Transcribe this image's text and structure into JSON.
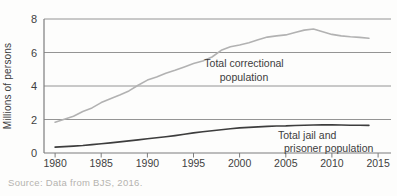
{
  "source": {
    "label": "Source: Data from BJS, 2016."
  },
  "chart_data": {
    "type": "line",
    "title": "",
    "xlabel": "",
    "ylabel": "Millions of persons",
    "grid": "horizontal",
    "legend_position": "inline-annotations",
    "xlim": [
      1978.8,
      2016.4
    ],
    "ylim": [
      0,
      8
    ],
    "x_ticks": [
      1980,
      1985,
      1990,
      1995,
      2000,
      2005,
      2010,
      2015
    ],
    "y_ticks": [
      0,
      2,
      4,
      6,
      8
    ],
    "x_years": [
      1980,
      1981,
      1982,
      1983,
      1984,
      1985,
      1986,
      1987,
      1988,
      1989,
      1990,
      1991,
      1992,
      1993,
      1994,
      1995,
      1996,
      1997,
      1998,
      1999,
      2000,
      2001,
      2002,
      2003,
      2004,
      2005,
      2006,
      2007,
      2008,
      2009,
      2010,
      2011,
      2012,
      2013,
      2014
    ],
    "colors": {
      "grid": "#949494",
      "axis": "#7d7d7d",
      "tick_text": "#3f3f3f",
      "source_text": "#b5b3af",
      "background": "#fdfdfc"
    },
    "series": [
      {
        "id": "total-correctional-population",
        "name": "Total correctional population",
        "color": "#b2b2b2",
        "width": 1.6,
        "values": [
          1.84,
          2.01,
          2.19,
          2.48,
          2.69,
          3.01,
          3.24,
          3.46,
          3.71,
          4.05,
          4.35,
          4.54,
          4.76,
          4.94,
          5.14,
          5.34,
          5.49,
          5.73,
          6.13,
          6.34,
          6.45,
          6.58,
          6.76,
          6.92,
          6.99,
          7.05,
          7.2,
          7.34,
          7.4,
          7.24,
          7.08,
          6.99,
          6.94,
          6.9,
          6.85
        ]
      },
      {
        "id": "total-jail-and-prisoner-population",
        "name": "Total jail and prisoner population",
        "color": "#3d3d3d",
        "width": 1.6,
        "values": [
          0.35,
          0.38,
          0.41,
          0.45,
          0.5,
          0.55,
          0.6,
          0.66,
          0.72,
          0.78,
          0.85,
          0.91,
          0.97,
          1.04,
          1.12,
          1.2,
          1.27,
          1.33,
          1.39,
          1.45,
          1.5,
          1.53,
          1.56,
          1.59,
          1.61,
          1.62,
          1.64,
          1.66,
          1.67,
          1.68,
          1.68,
          1.67,
          1.66,
          1.66,
          1.65
        ]
      }
    ],
    "annotations": [
      {
        "id": "label-total-correctional",
        "lines": [
          "Total correctional",
          "population"
        ],
        "x": 244,
        "y": 67,
        "line_height": 14,
        "align": "center",
        "dx": [
          0,
          0
        ]
      },
      {
        "id": "label-total-jail",
        "lines": [
          "Total jail and",
          "prisoner population"
        ],
        "x": 278,
        "y": 139,
        "line_height": 13,
        "align": "left",
        "dx": [
          0,
          6
        ]
      }
    ]
  }
}
